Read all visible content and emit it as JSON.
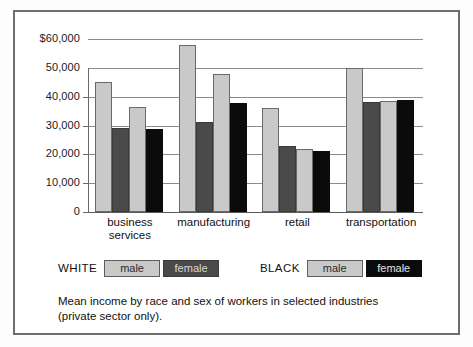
{
  "figure": {
    "caption_line1": "Mean income by race and sex of workers in selected industries",
    "caption_line2": "(private sector only)."
  },
  "legend": {
    "groups": [
      {
        "race_label": "WHITE",
        "entries": [
          {
            "label": "male",
            "color": "#c9c9c9",
            "style": "sw-light"
          },
          {
            "label": "female",
            "color": "#4a4a4a",
            "style": "sw-dark"
          }
        ]
      },
      {
        "race_label": "BLACK",
        "entries": [
          {
            "label": "male",
            "color": "#c9c9c9",
            "style": "sw-light"
          },
          {
            "label": "female",
            "color": "#0b0b0b",
            "style": "sw-black"
          }
        ]
      }
    ]
  },
  "chart_data": {
    "type": "bar",
    "title": "",
    "subtitle": "",
    "xlabel": "",
    "ylabel": "",
    "ylim": [
      0,
      60000
    ],
    "grid": true,
    "legend_position": "below-plot",
    "y_ticks": [
      0,
      10000,
      20000,
      30000,
      40000,
      50000,
      60000
    ],
    "y_tick_labels": [
      "0",
      "10,000",
      "20,000",
      "30,000",
      "40,000",
      "50,000",
      "$60,000"
    ],
    "categories": [
      "business services",
      "manufacturing",
      "retail",
      "transportation"
    ],
    "category_label_lines": [
      [
        "business",
        "services"
      ],
      [
        "manufacturing"
      ],
      [
        "retail"
      ],
      [
        "transportation"
      ]
    ],
    "series": [
      {
        "name": "WHITE male",
        "color": "#c9c9c9",
        "values": [
          45000,
          58000,
          36000,
          50000
        ]
      },
      {
        "name": "WHITE female",
        "color": "#4a4a4a",
        "values": [
          29000,
          31300,
          22800,
          38200
        ]
      },
      {
        "name": "BLACK male",
        "color": "#c9c9c9",
        "values": [
          36500,
          47700,
          21700,
          38400
        ]
      },
      {
        "name": "BLACK female",
        "color": "#0b0b0b",
        "values": [
          28800,
          37800,
          21000,
          38700
        ]
      }
    ]
  }
}
